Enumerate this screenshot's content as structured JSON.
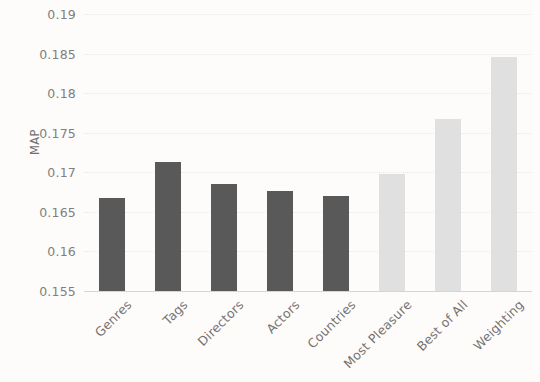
{
  "chart_data": {
    "type": "bar",
    "title": "",
    "subtitle": "",
    "xlabel": "",
    "ylabel": "MAP",
    "categories": [
      "Genres",
      "Tags",
      "Directors",
      "Actors",
      "Countries",
      "Most Pleasure",
      "Best of All",
      "Weighting"
    ],
    "values": [
      0.1667,
      0.1713,
      0.1685,
      0.1676,
      0.167,
      0.1698,
      0.1767,
      0.1846
    ],
    "bar_colors": [
      "#595959",
      "#595959",
      "#595959",
      "#595959",
      "#595959",
      "#e0e0e0",
      "#e0e0e0",
      "#e0e0e0"
    ],
    "ylim": [
      0.155,
      0.19
    ],
    "ytick_labels": [
      "0.19",
      "0.185",
      "0.18",
      "0.175",
      "0.17",
      "0.165",
      "0.16",
      "0.155"
    ],
    "ytick_values": [
      0.19,
      0.185,
      0.18,
      0.175,
      0.17,
      0.165,
      0.16,
      0.155
    ],
    "grid": true,
    "grid_axis": "y",
    "legend": false,
    "legend_position": "none",
    "xtick_rotation": -45,
    "background_color": "#fdfcfa",
    "gridline_color": "#ece9e4",
    "axis_color": "#d8d5d0",
    "tick_text_color": "#808080",
    "axis_title_color": "#6e6e6e"
  }
}
